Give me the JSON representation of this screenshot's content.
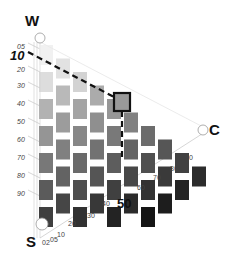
{
  "diagram": {
    "type": "ternary-grayscale-grid",
    "vertices": {
      "top": "W",
      "bottom_left": "S",
      "right": "C"
    },
    "left_axis_ticks": [
      "05",
      "10",
      "20",
      "30",
      "40",
      "50",
      "60",
      "70",
      "80",
      "90"
    ],
    "bottom_axis_ticks": [
      "02",
      "05",
      "10",
      "20",
      "30",
      "40",
      "50",
      "60",
      "70",
      "80",
      "90"
    ],
    "highlight": {
      "w_label": "10",
      "c_label": "50"
    },
    "colors": {
      "background": "#ffffff",
      "guide_line": "#bbbbbb",
      "highlight_border": "#111111",
      "dashed_line": "#111111"
    }
  }
}
